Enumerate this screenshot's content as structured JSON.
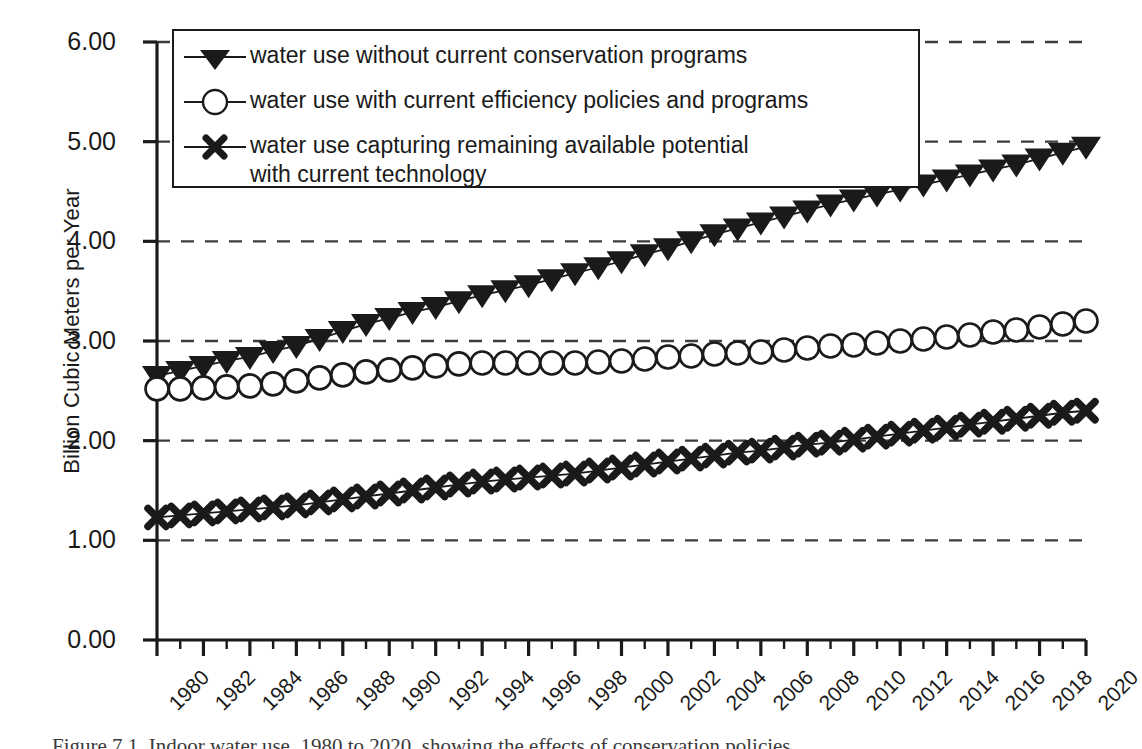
{
  "chart_data": {
    "type": "line",
    "title": "",
    "xlabel": "",
    "ylabel": "Billion Cubic Meters per Year",
    "ylim": [
      0.0,
      6.0
    ],
    "xlim": [
      1980,
      2020
    ],
    "grid": true,
    "grid_style": "dashed horizontal",
    "legend_position": "top-left inside plot",
    "ytick_labels": [
      "0.00",
      "1.00",
      "2.00",
      "3.00",
      "4.00",
      "5.00",
      "6.00"
    ],
    "ytick_values": [
      0.0,
      1.0,
      2.0,
      3.0,
      4.0,
      5.0,
      6.0
    ],
    "xtick_labels": [
      "1980",
      "1982",
      "1984",
      "1986",
      "1988",
      "1990",
      "1992",
      "1994",
      "1996",
      "1998",
      "2000",
      "2002",
      "2004",
      "2006",
      "2008",
      "2010",
      "2012",
      "2014",
      "2016",
      "2018",
      "2020"
    ],
    "xtick_values": [
      1980,
      1982,
      1984,
      1986,
      1988,
      1990,
      1992,
      1994,
      1996,
      1998,
      2000,
      2002,
      2004,
      2006,
      2008,
      2010,
      2012,
      2014,
      2016,
      2018,
      2020
    ],
    "x": [
      1980,
      1981,
      1982,
      1983,
      1984,
      1985,
      1986,
      1987,
      1988,
      1989,
      1990,
      1991,
      1992,
      1993,
      1994,
      1995,
      1996,
      1997,
      1998,
      1999,
      2000,
      2001,
      2002,
      2003,
      2004,
      2005,
      2006,
      2007,
      2008,
      2009,
      2010,
      2011,
      2012,
      2013,
      2014,
      2015,
      2016,
      2017,
      2018,
      2019,
      2020
    ],
    "series": [
      {
        "name": "water use without current conservation programs",
        "marker": "triangle-down-filled",
        "values": [
          2.65,
          2.7,
          2.75,
          2.8,
          2.84,
          2.9,
          2.95,
          3.02,
          3.1,
          3.17,
          3.23,
          3.29,
          3.34,
          3.4,
          3.46,
          3.51,
          3.56,
          3.62,
          3.68,
          3.74,
          3.8,
          3.87,
          3.93,
          4.0,
          4.07,
          4.13,
          4.19,
          4.25,
          4.31,
          4.37,
          4.42,
          4.47,
          4.52,
          4.57,
          4.62,
          4.67,
          4.72,
          4.77,
          4.83,
          4.89,
          4.95
        ]
      },
      {
        "name": "water use with current efficiency policies and programs",
        "marker": "circle-open",
        "values": [
          2.52,
          2.52,
          2.53,
          2.54,
          2.55,
          2.57,
          2.6,
          2.63,
          2.66,
          2.69,
          2.71,
          2.73,
          2.75,
          2.77,
          2.78,
          2.78,
          2.78,
          2.78,
          2.78,
          2.79,
          2.8,
          2.82,
          2.84,
          2.85,
          2.87,
          2.88,
          2.89,
          2.91,
          2.93,
          2.95,
          2.96,
          2.98,
          3.0,
          3.02,
          3.04,
          3.06,
          3.09,
          3.11,
          3.14,
          3.17,
          3.2
        ]
      },
      {
        "name": "water use capturing remaining available potential with current technology",
        "marker": "x-bold",
        "values": [
          1.23,
          1.25,
          1.27,
          1.29,
          1.31,
          1.33,
          1.35,
          1.38,
          1.41,
          1.44,
          1.47,
          1.5,
          1.53,
          1.56,
          1.59,
          1.61,
          1.63,
          1.65,
          1.67,
          1.7,
          1.73,
          1.76,
          1.79,
          1.82,
          1.85,
          1.88,
          1.9,
          1.93,
          1.96,
          1.98,
          2.01,
          2.04,
          2.07,
          2.1,
          2.13,
          2.16,
          2.19,
          2.22,
          2.25,
          2.28,
          2.3
        ]
      }
    ]
  },
  "legend": {
    "entries": [
      {
        "label": "water use without current conservation programs",
        "marker": "triangle-down-filled"
      },
      {
        "label": "water use with current efficiency policies and programs",
        "marker": "circle-open"
      },
      {
        "label": "water use capturing remaining available potential\nwith current technology",
        "marker": "x-bold"
      }
    ]
  },
  "axes": {
    "y_title": "Billion Cubic Meters per Year"
  },
  "caption": {
    "text": "Figure 7.1.  Indoor water use, 1980 to 2020, showing the effects of conservation policies"
  },
  "colors": {
    "ink": "#1a1a1a",
    "grid": "#3c3c3c",
    "background": "#ffffff"
  }
}
